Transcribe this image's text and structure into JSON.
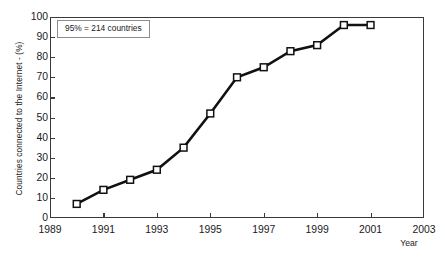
{
  "chart_data": {
    "type": "line",
    "title": "",
    "xlabel": "Year",
    "ylabel": "Countries connected to the Internet - (%)",
    "xlim": [
      1989,
      2003
    ],
    "ylim": [
      0,
      100
    ],
    "grid": false,
    "legend": null,
    "x_ticks": [
      "1989",
      "1991",
      "1993",
      "1995",
      "1997",
      "1999",
      "2001",
      "2003"
    ],
    "x_tick_values": [
      1989,
      1991,
      1993,
      1995,
      1997,
      1999,
      2001,
      2003
    ],
    "y_ticks": [
      "0",
      "10",
      "20",
      "30",
      "40",
      "50",
      "60",
      "70",
      "80",
      "90",
      "100"
    ],
    "y_tick_values": [
      0,
      10,
      20,
      30,
      40,
      50,
      60,
      70,
      80,
      90,
      100
    ],
    "x": [
      1990,
      1991,
      1992,
      1993,
      1994,
      1995,
      1996,
      1997,
      1998,
      1999,
      2000,
      2001
    ],
    "values": [
      7,
      14,
      19,
      24,
      35,
      52,
      70,
      75,
      83,
      86,
      96,
      96
    ],
    "series": [
      {
        "name": "Countries connected to the Internet",
        "x": [
          1990,
          1991,
          1992,
          1993,
          1994,
          1995,
          1996,
          1997,
          1998,
          1999,
          2000,
          2001
        ],
        "values": [
          7,
          14,
          19,
          24,
          35,
          52,
          70,
          75,
          83,
          86,
          96,
          96
        ],
        "marker": "square-open",
        "line_color": "#111111",
        "marker_face": "#ffffff",
        "marker_edge": "#111111"
      }
    ],
    "annotations": [
      {
        "text": "95% = 214 countries",
        "x": 1989.3,
        "y": 94
      }
    ]
  },
  "annotation": {
    "text": "95% = 214 countries"
  },
  "axes": {
    "y_title": "Countries connected to the Internet - (%)",
    "x_title": "Year"
  },
  "colors": {
    "line": "#111111",
    "frame": "#3a3a3a",
    "marker_fill": "#ffffff",
    "text": "#1a1a1a",
    "background": "#ffffff"
  }
}
